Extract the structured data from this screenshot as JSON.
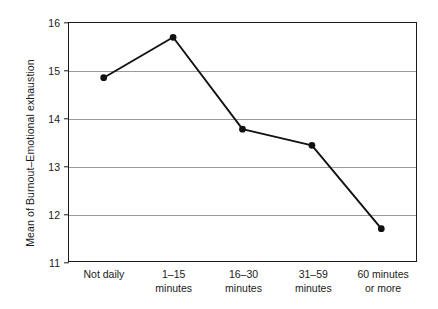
{
  "chart_data": {
    "type": "line",
    "title": "",
    "xlabel": "",
    "ylabel": "Mean of Burnout–Emotional exhaustion",
    "categories": [
      "Not daily",
      "1–15 minutes",
      "16–30 minutes",
      "31–59 minutes",
      "60 minutes or more"
    ],
    "category_lines": [
      [
        "Not daily"
      ],
      [
        "1–15",
        "minutes"
      ],
      [
        "16–30",
        "minutes"
      ],
      [
        "31–59",
        "minutes"
      ],
      [
        "60 minutes",
        "or more"
      ]
    ],
    "values": [
      14.85,
      15.7,
      13.77,
      13.43,
      11.68
    ],
    "ylim": [
      11,
      16
    ],
    "yticks": [
      11,
      12,
      13,
      14,
      15,
      16
    ],
    "ytick_labels": [
      "11",
      "12",
      "13",
      "14",
      "15",
      "16"
    ],
    "grid": true,
    "legend": "none",
    "series": [
      {
        "name": "Mean of Burnout–Emotional exhaustion",
        "values": [
          14.85,
          15.7,
          13.77,
          13.43,
          11.68
        ],
        "line_color": "#111111",
        "marker": "circle",
        "marker_color": "#111111"
      }
    ],
    "colors": {
      "line": "#111111",
      "marker": "#111111",
      "grid": "#9a9a9a",
      "axis": "#1a1a1a",
      "background": "#ffffff",
      "text": "#1a1a1a"
    }
  }
}
